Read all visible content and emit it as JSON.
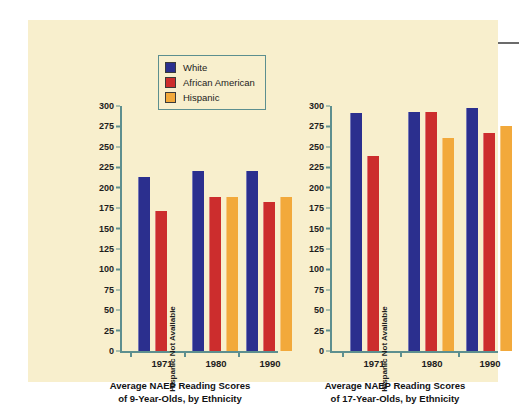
{
  "figure": {
    "background_color": "#f8efcd",
    "axis_color": "#5d8f8f"
  },
  "legend": {
    "position": "top-center-left",
    "entries": [
      {
        "label": "White",
        "color": "#2b2f8e"
      },
      {
        "label": "African American",
        "color": "#cc2d2d"
      },
      {
        "label": "Hispanic",
        "color": "#f2a93b"
      }
    ]
  },
  "notes": {
    "not_available": "Hispanic Not Available"
  },
  "chart_data": [
    {
      "type": "bar",
      "id": "naep-9-year-olds",
      "title": "Average NAEP Reading Scores of 9-Year-Olds, by Ethnicity",
      "title_line1": "Average NAEP Reading Scores",
      "title_line2": "of 9-Year-Olds, by Ethnicity",
      "xlabel": "",
      "ylabel": "",
      "ylim": [
        0,
        300
      ],
      "yticks": [
        0,
        25,
        50,
        75,
        100,
        125,
        150,
        175,
        200,
        225,
        250,
        275,
        300
      ],
      "grid": false,
      "legend_position": "top-center",
      "categories": [
        "1971",
        "1980",
        "1990"
      ],
      "series": [
        {
          "name": "White",
          "color": "#2b2f8e",
          "values": [
            213,
            221,
            220
          ]
        },
        {
          "name": "African American",
          "color": "#cc2d2d",
          "values": [
            171,
            189,
            182
          ]
        },
        {
          "name": "Hispanic",
          "color": "#f2a93b",
          "values": [
            null,
            189,
            189
          ]
        }
      ],
      "annotations": [
        {
          "category": "1971",
          "series": "Hispanic",
          "text": "Hispanic Not Available"
        }
      ]
    },
    {
      "type": "bar",
      "id": "naep-17-year-olds",
      "title": "Average NAEP Reading Scores of 17-Year-Olds, by Ethnicity",
      "title_line1": "Average NAEP Reading Scores",
      "title_line2": "of 17-Year-Olds, by Ethnicity",
      "xlabel": "",
      "ylabel": "",
      "ylim": [
        0,
        300
      ],
      "yticks": [
        0,
        25,
        50,
        75,
        100,
        125,
        150,
        175,
        200,
        225,
        250,
        275,
        300
      ],
      "grid": false,
      "legend_position": "top-center",
      "categories": [
        "1971",
        "1980",
        "1990"
      ],
      "series": [
        {
          "name": "White",
          "color": "#2b2f8e",
          "values": [
            291,
            293,
            297
          ]
        },
        {
          "name": "African American",
          "color": "#cc2d2d",
          "values": [
            239,
            293,
            267
          ]
        },
        {
          "name": "Hispanic",
          "color": "#f2a93b",
          "values": [
            null,
            261,
            275
          ]
        }
      ],
      "annotations": [
        {
          "category": "1971",
          "series": "Hispanic",
          "text": "Hispanic Not Available"
        }
      ]
    }
  ]
}
